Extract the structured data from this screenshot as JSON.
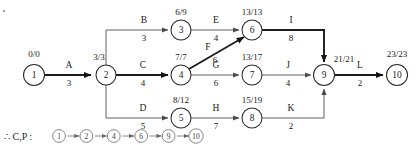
{
  "diagram": {
    "type": "activity-on-arrow-network",
    "nodes": [
      {
        "id": "1",
        "label": "1",
        "times": "0/0",
        "cx": 34,
        "cy": 75,
        "r": 10.5,
        "time_x": 34,
        "time_y": 57
      },
      {
        "id": "2",
        "label": "2",
        "times": "3/3",
        "cx": 106,
        "cy": 75,
        "r": 10.0,
        "time_x": 99,
        "time_y": 60
      },
      {
        "id": "3",
        "label": "3",
        "times": "6/9",
        "cx": 181,
        "cy": 30,
        "r": 10.0,
        "time_x": 181,
        "time_y": 15
      },
      {
        "id": "4",
        "label": "4",
        "times": "7/7",
        "cx": 181,
        "cy": 75,
        "r": 10.0,
        "time_x": 181,
        "time_y": 60
      },
      {
        "id": "5",
        "label": "5",
        "times": "8/12",
        "cx": 181,
        "cy": 118,
        "r": 10.0,
        "time_x": 181,
        "time_y": 103
      },
      {
        "id": "6",
        "label": "6",
        "times": "13/13",
        "cx": 252,
        "cy": 30,
        "r": 10.0,
        "time_x": 252,
        "time_y": 15
      },
      {
        "id": "7",
        "label": "7",
        "times": "13/17",
        "cx": 252,
        "cy": 75,
        "r": 10.0,
        "time_x": 252,
        "time_y": 60
      },
      {
        "id": "8",
        "label": "8",
        "times": "15/19",
        "cx": 252,
        "cy": 118,
        "r": 10.0,
        "time_x": 252,
        "time_y": 103
      },
      {
        "id": "9",
        "label": "9",
        "times": "21/21",
        "cx": 324,
        "cy": 75,
        "r": 10.5,
        "time_x": 344,
        "time_y": 62
      },
      {
        "id": "10",
        "label": "10",
        "times": "23/23",
        "cx": 397,
        "cy": 75,
        "r": 10.5,
        "time_x": 397,
        "time_y": 57
      }
    ],
    "edges": [
      {
        "name": "A",
        "duration": "3",
        "from": "1",
        "to": "2",
        "critical": true,
        "path": "M 45 75 L 91 75",
        "name_x": 69,
        "name_y": 68,
        "dur_x": 69,
        "dur_y": 86
      },
      {
        "name": "B",
        "duration": "3",
        "from": "2",
        "to": "3",
        "critical": false,
        "path": "M 106 65 L 106 30 L 168 30",
        "name_x": 144,
        "name_y": 23,
        "dur_x": 144,
        "dur_y": 41
      },
      {
        "name": "C",
        "duration": "4",
        "from": "2",
        "to": "4",
        "critical": true,
        "path": "M 116 75 L 168 75",
        "name_x": 143,
        "name_y": 68,
        "dur_x": 143,
        "dur_y": 86
      },
      {
        "name": "D",
        "duration": "5",
        "from": "2",
        "to": "5",
        "critical": false,
        "path": "M 106 85 L 106 118 L 168 118",
        "name_x": 143,
        "name_y": 111,
        "dur_x": 143,
        "dur_y": 129
      },
      {
        "name": "E",
        "duration": "4",
        "from": "3",
        "to": "6",
        "critical": false,
        "path": "M 191 30 L 239 30",
        "name_x": 216,
        "name_y": 23,
        "dur_x": 216,
        "dur_y": 41
      },
      {
        "name": "F",
        "duration": "6",
        "from": "4",
        "to": "6",
        "critical": true,
        "path": "M 189 69 L 244 37",
        "name_x": 208,
        "name_y": 50,
        "dur_x": 215,
        "dur_y": 63
      },
      {
        "name": "G",
        "duration": "6",
        "from": "4",
        "to": "7",
        "critical": false,
        "path": "M 191 75 L 239 75",
        "name_x": 216,
        "name_y": 68,
        "dur_x": 216,
        "dur_y": 86
      },
      {
        "name": "H",
        "duration": "7",
        "from": "5",
        "to": "8",
        "critical": false,
        "path": "M 191 118 L 239 118",
        "name_x": 216,
        "name_y": 111,
        "dur_x": 216,
        "dur_y": 129
      },
      {
        "name": "I",
        "duration": "8",
        "from": "6",
        "to": "9",
        "critical": true,
        "path": "M 262 30 L 324 30 L 324 62",
        "name_x": 291,
        "name_y": 23,
        "dur_x": 291,
        "dur_y": 41
      },
      {
        "name": "J",
        "duration": "4",
        "from": "7",
        "to": "9",
        "critical": false,
        "path": "M 262 75 L 311 75",
        "name_x": 288,
        "name_y": 68,
        "dur_x": 288,
        "dur_y": 86
      },
      {
        "name": "K",
        "duration": "2",
        "from": "8",
        "to": "9",
        "critical": false,
        "path": "M 262 118 L 324 118 L 324 89",
        "name_x": 291,
        "name_y": 111,
        "dur_x": 291,
        "dur_y": 129
      },
      {
        "name": "L",
        "duration": "2",
        "from": "9",
        "to": "10",
        "critical": true,
        "path": "M 335 75 L 383 75",
        "name_x": 360,
        "name_y": 68,
        "dur_x": 360,
        "dur_y": 86
      }
    ]
  },
  "critical_path": {
    "prefix": "∴  C,P :",
    "nodes": [
      "1",
      "2",
      "4",
      "6",
      "9",
      "10"
    ],
    "separator": "→"
  }
}
